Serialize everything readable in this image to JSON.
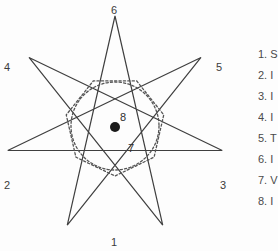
{
  "figure": {
    "type": "heptagram-diagram",
    "line_color": "#3f3f3f",
    "dotted_color": "#555555",
    "center_dot_color": "#1a1a1a",
    "background": "#fdfdfd",
    "star": {
      "points": 7,
      "step": 3,
      "center_x": 115,
      "center_y": 126,
      "outer_radius": 110,
      "rotation_deg": -90
    },
    "inner_circle": {
      "center_x": 115,
      "center_y": 126,
      "radius": 44,
      "style": "dotted"
    },
    "inner_polygon": {
      "sides": 7,
      "center_x": 115,
      "center_y": 126,
      "radius": 50,
      "style": "dotted"
    },
    "center_dot": {
      "x": 115,
      "y": 127,
      "radius": 5
    },
    "vertex_labels": [
      {
        "label": "6",
        "x": 111,
        "y": 5
      },
      {
        "label": "4",
        "x": 4,
        "y": 62
      },
      {
        "label": "5",
        "x": 216,
        "y": 62
      },
      {
        "label": "2",
        "x": 4,
        "y": 180
      },
      {
        "label": "3",
        "x": 220,
        "y": 180
      },
      {
        "label": "1",
        "x": 111,
        "y": 237
      }
    ],
    "inner_labels": [
      {
        "label": "8",
        "x": 120,
        "y": 112
      },
      {
        "label": "7",
        "x": 128,
        "y": 143
      }
    ]
  },
  "legend": {
    "items": [
      {
        "number": "1.",
        "text": "S"
      },
      {
        "number": "2.",
        "text": "I"
      },
      {
        "number": "3.",
        "text": "I"
      },
      {
        "number": "4.",
        "text": "I"
      },
      {
        "number": "5.",
        "text": "T"
      },
      {
        "number": "6.",
        "text": "I"
      },
      {
        "number": "7.",
        "text": "V"
      },
      {
        "number": "8.",
        "text": "I"
      }
    ]
  }
}
